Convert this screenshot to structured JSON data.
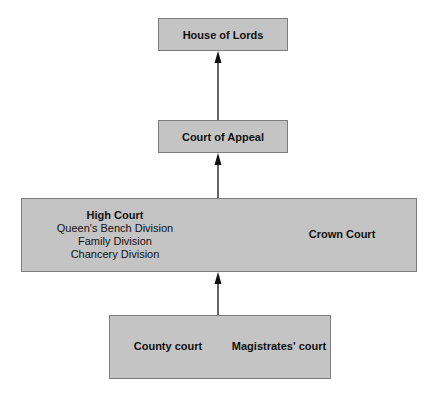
{
  "diagram": {
    "type": "hierarchy",
    "direction": "bottom-to-top",
    "nodes": {
      "house_of_lords": {
        "label": "House of Lords"
      },
      "court_of_appeal": {
        "label": "Court of Appeal"
      },
      "high_court": {
        "label": "High Court",
        "divisions": [
          "Queen's Bench Division",
          "Family Division",
          "Chancery Division"
        ]
      },
      "crown_court": {
        "label": "Crown Court"
      },
      "county_court": {
        "label": "County court"
      },
      "magistrates_court": {
        "label": "Magistrates' court"
      }
    },
    "edges": [
      {
        "from": "County court / Magistrates' court",
        "to": "High Court / Crown Court"
      },
      {
        "from": "High Court / Crown Court",
        "to": "Court of Appeal"
      },
      {
        "from": "Court of Appeal",
        "to": "House of Lords"
      }
    ],
    "colors": {
      "box_fill": "#c4c4c4",
      "box_border": "#7d7d7d",
      "arrow": "#111111",
      "background": "#ffffff"
    }
  }
}
